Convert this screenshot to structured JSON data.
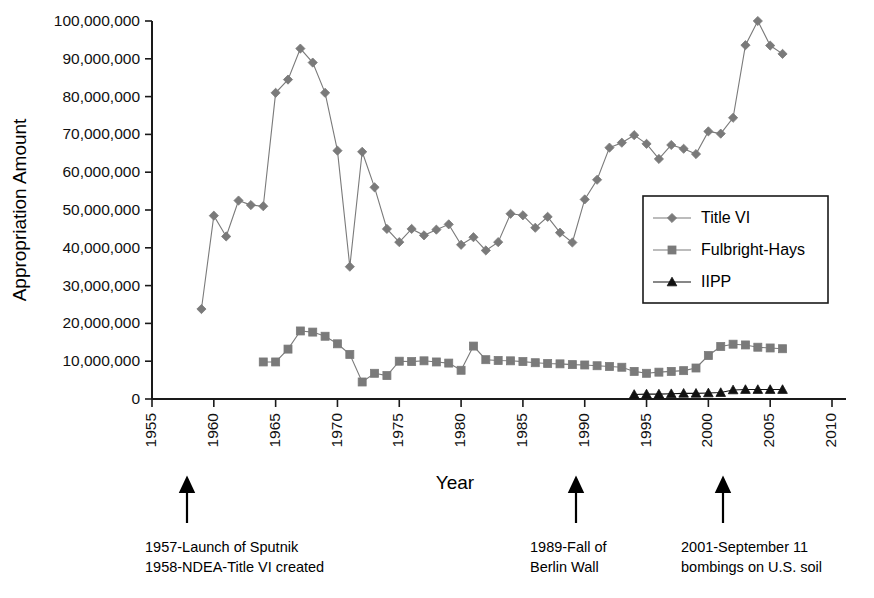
{
  "chart_data": {
    "type": "line",
    "title": "",
    "xlabel": "Year",
    "ylabel": "Appropriation Amount",
    "xlim": [
      1955,
      2010
    ],
    "ylim": [
      0,
      100000000
    ],
    "xticks": [
      1955,
      1960,
      1965,
      1970,
      1975,
      1980,
      1985,
      1990,
      1995,
      2000,
      2005,
      2010
    ],
    "xtick_labels": [
      "1955",
      "1960",
      "1965",
      "1970",
      "1975",
      "1980",
      "1985",
      "1990",
      "1995",
      "2000",
      "2005",
      "2010"
    ],
    "yticks": [
      0,
      10000000,
      20000000,
      30000000,
      40000000,
      50000000,
      60000000,
      70000000,
      80000000,
      90000000,
      100000000
    ],
    "ytick_labels": [
      "0",
      "10,000,000",
      "20,000,000",
      "30,000,000",
      "40,000,000",
      "50,000,000",
      "60,000,000",
      "70,000,000",
      "80,000,000",
      "90,000,000",
      "100,000,000"
    ],
    "grid": false,
    "legend_position": "center-right",
    "series": [
      {
        "name": "Title VI",
        "marker": "diamond",
        "color": "#7a7a7a",
        "x": [
          1959,
          1960,
          1961,
          1962,
          1963,
          1964,
          1965,
          1966,
          1967,
          1968,
          1969,
          1970,
          1971,
          1972,
          1973,
          1974,
          1975,
          1976,
          1977,
          1978,
          1979,
          1980,
          1981,
          1982,
          1983,
          1984,
          1985,
          1986,
          1987,
          1988,
          1989,
          1990,
          1991,
          1992,
          1993,
          1994,
          1995,
          1996,
          1997,
          1998,
          1999,
          2000,
          2001,
          2002,
          2003,
          2004,
          2005,
          2006
        ],
        "values": [
          23800000,
          48500000,
          43000000,
          52500000,
          51300000,
          51000000,
          81000000,
          84500000,
          92700000,
          89000000,
          81000000,
          65700000,
          35000000,
          65400000,
          56000000,
          45000000,
          41500000,
          45000000,
          43300000,
          44800000,
          46200000,
          40800000,
          42800000,
          39300000,
          41500000,
          49000000,
          48600000,
          45300000,
          48200000,
          44000000,
          41400000,
          52800000,
          58000000,
          66500000,
          67800000,
          69800000,
          67500000,
          63500000,
          67200000,
          66200000,
          64800000,
          70800000,
          70200000,
          74400000,
          93600000,
          100000000,
          93500000,
          91300000
        ]
      },
      {
        "name": "Fulbright-Hays",
        "marker": "square",
        "color": "#7a7a7a",
        "x": [
          1964,
          1965,
          1966,
          1967,
          1968,
          1969,
          1970,
          1971,
          1972,
          1973,
          1974,
          1975,
          1976,
          1977,
          1978,
          1979,
          1980,
          1981,
          1982,
          1983,
          1984,
          1985,
          1986,
          1987,
          1988,
          1989,
          1990,
          1991,
          1992,
          1993,
          1994,
          1995,
          1996,
          1997,
          1998,
          1999,
          2000,
          2001,
          2002,
          2003,
          2004,
          2005,
          2006
        ],
        "values": [
          9800000,
          9800000,
          13200000,
          18000000,
          17700000,
          16600000,
          14600000,
          11800000,
          4500000,
          6800000,
          6200000,
          10000000,
          9900000,
          10100000,
          9800000,
          9500000,
          7600000,
          14000000,
          10400000,
          10200000,
          10100000,
          9900000,
          9600000,
          9400000,
          9300000,
          9100000,
          9000000,
          8800000,
          8600000,
          8400000,
          7300000,
          6800000,
          7100000,
          7300000,
          7500000,
          8200000,
          11500000,
          13900000,
          14500000,
          14300000,
          13700000,
          13500000,
          13300000
        ]
      },
      {
        "name": "IIPP",
        "marker": "triangle",
        "color": "#111111",
        "x": [
          1994,
          1995,
          1996,
          1997,
          1998,
          1999,
          2000,
          2001,
          2002,
          2003,
          2004,
          2005,
          2006
        ],
        "values": [
          1200000,
          1300000,
          1300000,
          1400000,
          1500000,
          1500000,
          1600000,
          1700000,
          2400000,
          2500000,
          2500000,
          2500000,
          2500000
        ]
      }
    ],
    "annotations": [
      {
        "id": "sputnik",
        "year": 1957,
        "lines": [
          "1957-Launch of Sputnik",
          "1958-NDEA-Title VI created"
        ]
      },
      {
        "id": "berlin-wall",
        "year": 1989,
        "lines": [
          "1989-Fall of",
          "Berlin Wall"
        ]
      },
      {
        "id": "september-11",
        "year": 2001,
        "lines": [
          "2001-September 11",
          "bombings on U.S. soil"
        ]
      }
    ]
  }
}
